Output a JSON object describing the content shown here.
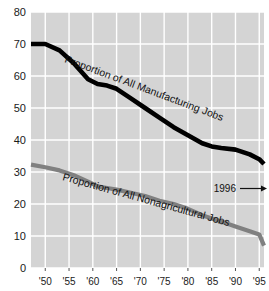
{
  "chart_data": {
    "type": "line",
    "title": "",
    "xlabel": "",
    "ylabel": "",
    "xlim": [
      1947,
      1996
    ],
    "ylim": [
      0,
      80
    ],
    "grid": true,
    "legend_position": "inline-on-line",
    "y_ticks": [
      "0",
      "10",
      "20",
      "30",
      "40",
      "50",
      "60",
      "70",
      "80"
    ],
    "y_tick_values": [
      0,
      10,
      20,
      30,
      40,
      50,
      60,
      70,
      80
    ],
    "x_ticks": [
      "'50",
      "'55",
      "'60",
      "'65",
      "'70",
      "'75",
      "'80",
      "'85",
      "'90",
      "'95"
    ],
    "x_tick_values": [
      1950,
      1955,
      1960,
      1965,
      1970,
      1975,
      1980,
      1985,
      1990,
      1995
    ],
    "series": [
      {
        "name": "Proportion of All Manufacturing Jobs",
        "color": "#000000",
        "x": [
          1947,
          1950,
          1953,
          1956,
          1959,
          1961,
          1963,
          1965,
          1968,
          1971,
          1974,
          1977,
          1980,
          1983,
          1985,
          1987,
          1990,
          1993,
          1995,
          1996
        ],
        "values": [
          70,
          70,
          68,
          64,
          59,
          57.5,
          57,
          56,
          53,
          50,
          47,
          44,
          41.5,
          39,
          38,
          37.5,
          37,
          35.5,
          34,
          32.5
        ]
      },
      {
        "name": "Proportion of All Nonagricultural Jobs",
        "color": "#808080",
        "x": [
          1947,
          1950,
          1953,
          1956,
          1959,
          1961,
          1963,
          1965,
          1968,
          1971,
          1974,
          1977,
          1980,
          1983,
          1985,
          1987,
          1990,
          1993,
          1995,
          1996
        ],
        "values": [
          32.3,
          31.5,
          30.5,
          29,
          27,
          25.5,
          25,
          24.5,
          23.5,
          22.5,
          21,
          20,
          18.5,
          16.5,
          15.5,
          14.5,
          13,
          11.5,
          10.5,
          7
        ]
      }
    ],
    "annotations": [
      {
        "text": "1996",
        "arrow": "→",
        "x": 1992,
        "y": 22
      }
    ]
  },
  "axis": {
    "y_labels": [
      "80",
      "70",
      "60",
      "50",
      "40",
      "30",
      "20",
      "10",
      "0"
    ],
    "x_labels": [
      "'50",
      "'55",
      "'60",
      "'65",
      "'70",
      "'75",
      "'80",
      "'85",
      "'90",
      "'95"
    ]
  },
  "labels": {
    "manufacturing": "Proportion of All Manufacturing Jobs",
    "nonagricultural": "Proportion of All Nonagricultural Jobs",
    "annotation_year": "1996",
    "annotation_arrow": "→"
  },
  "colors": {
    "plot_background": "#d4d4d4",
    "gridline": "#ffffff",
    "manufacturing_line": "#000000",
    "nonagricultural_line": "#808080",
    "text": "#111111",
    "page_background": "#ffffff"
  }
}
